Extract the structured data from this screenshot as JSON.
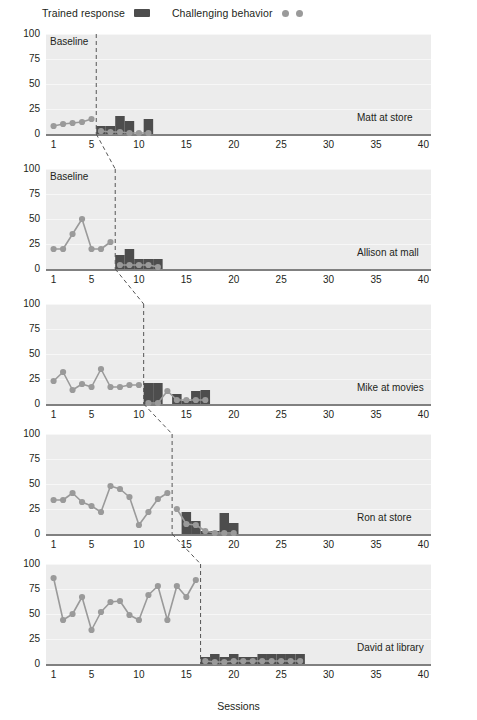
{
  "legend": {
    "trained_label": "Trained response",
    "trained_icon": "bar-swatch",
    "challenging_label": "Challenging behavior",
    "challenging_icon": "dot-swatch",
    "bar_color": "#4d4d4d",
    "dot_color": "#9a9a9a"
  },
  "axes": {
    "ylabel": "Percent of intervals",
    "xlabel": "Sessions",
    "yticks": [
      "0",
      "25",
      "50",
      "75",
      "100"
    ],
    "xticks": [
      "1",
      "5",
      "10",
      "15",
      "20",
      "25",
      "30",
      "35",
      "40"
    ],
    "xtick_values": [
      1,
      5,
      10,
      15,
      20,
      25,
      30,
      35,
      40
    ],
    "ylim": [
      0,
      100
    ],
    "xlim": [
      0.2,
      40.8
    ],
    "phase_label": "Baseline"
  },
  "panels": [
    {
      "label": "Matt at store",
      "phase_label": "Baseline",
      "phase_line_x": 5.5,
      "show_phase_label": true
    },
    {
      "label": "Allison at mall",
      "phase_label": "Baseline",
      "phase_line_x": 7.5,
      "show_phase_label": true
    },
    {
      "label": "Mike at movies",
      "phase_label": "",
      "phase_line_x": 10.5,
      "show_phase_label": false
    },
    {
      "label": "Ron at store",
      "phase_label": "",
      "phase_line_x": 13.5,
      "show_phase_label": false
    },
    {
      "label": "David at library",
      "phase_label": "",
      "phase_line_x": 16.5,
      "show_phase_label": false
    }
  ],
  "chart_data": {
    "type": "line",
    "title": "",
    "subtitle": "",
    "xlabel": "Sessions",
    "ylabel": "Percent of intervals",
    "xlim": [
      0.2,
      40.8
    ],
    "ylim": [
      0,
      100
    ],
    "yticks": [
      0,
      25,
      50,
      75,
      100
    ],
    "xticks": [
      1,
      5,
      10,
      15,
      20,
      25,
      30,
      35,
      40
    ],
    "grid": true,
    "legend_position": "top-left",
    "design": "multiple-baseline-across-participants",
    "series_legend": [
      "Trained response",
      "Challenging behavior"
    ],
    "panels": [
      {
        "name": "Matt at store",
        "phase_change_session": 5.5,
        "baseline": {
          "x": [
            1,
            2,
            3,
            4,
            5
          ],
          "challenging_behavior": [
            8,
            10,
            11,
            12,
            15
          ],
          "trained_response": [
            0,
            0,
            0,
            0,
            0
          ]
        },
        "intervention": {
          "x": [
            6,
            7,
            8,
            9,
            10,
            11
          ],
          "trained_response": [
            8,
            8,
            18,
            13,
            0,
            15
          ],
          "challenging_behavior": [
            3,
            2,
            2,
            1,
            1,
            1
          ]
        }
      },
      {
        "name": "Allison at mall",
        "phase_change_session": 7.5,
        "baseline": {
          "x": [
            1,
            2,
            3,
            4,
            5,
            6,
            7
          ],
          "challenging_behavior": [
            20,
            20,
            35,
            50,
            20,
            20,
            27
          ],
          "trained_response": [
            0,
            0,
            0,
            0,
            0,
            0,
            0
          ]
        },
        "intervention": {
          "x": [
            8,
            9,
            10,
            11,
            12
          ],
          "trained_response": [
            14,
            20,
            10,
            10,
            10
          ],
          "challenging_behavior": [
            4,
            4,
            4,
            4,
            2
          ]
        }
      },
      {
        "name": "Mike at movies",
        "phase_change_session": 10.5,
        "baseline": {
          "x": [
            1,
            2,
            3,
            4,
            5,
            6,
            7,
            8,
            9,
            10
          ],
          "challenging_behavior": [
            23,
            32,
            14,
            20,
            17,
            35,
            17,
            17,
            19,
            19
          ],
          "trained_response": [
            0,
            0,
            0,
            0,
            0,
            0,
            0,
            0,
            0,
            0
          ]
        },
        "intervention": {
          "x": [
            11,
            12,
            13,
            14,
            15,
            16,
            17
          ],
          "trained_response": [
            21,
            21,
            0,
            10,
            3,
            13,
            14
          ],
          "challenging_behavior": [
            1,
            1,
            13,
            4,
            4,
            4,
            4
          ]
        }
      },
      {
        "name": "Ron at store",
        "phase_change_session": 13.5,
        "baseline": {
          "x": [
            1,
            2,
            3,
            4,
            5,
            6,
            7,
            8,
            9,
            10,
            11,
            12,
            13
          ],
          "challenging_behavior": [
            34,
            34,
            41,
            32,
            28,
            22,
            48,
            45,
            37,
            9,
            22,
            35,
            41
          ],
          "trained_response": [
            0,
            0,
            0,
            0,
            0,
            0,
            0,
            0,
            0,
            0,
            0,
            0,
            0
          ]
        },
        "intervention": {
          "x": [
            14,
            15,
            16,
            17,
            18,
            19,
            20
          ],
          "trained_response": [
            0,
            22,
            13,
            3,
            3,
            21,
            11
          ],
          "challenging_behavior": [
            25,
            10,
            9,
            3,
            1,
            1,
            1
          ]
        }
      },
      {
        "name": "David at library",
        "phase_change_session": 16.5,
        "baseline": {
          "x": [
            1,
            2,
            3,
            4,
            5,
            6,
            7,
            8,
            9,
            10,
            11,
            12,
            13,
            14,
            15,
            16
          ],
          "challenging_behavior": [
            86,
            44,
            50,
            67,
            34,
            52,
            62,
            63,
            49,
            44,
            69,
            78,
            44,
            78,
            67,
            84
          ],
          "trained_response": [
            0,
            0,
            0,
            0,
            0,
            0,
            0,
            0,
            0,
            0,
            0,
            0,
            0,
            0,
            0,
            0
          ]
        },
        "intervention": {
          "x": [
            17,
            18,
            19,
            20,
            21,
            22,
            23,
            24,
            25,
            26,
            27
          ],
          "trained_response": [
            7,
            10,
            7,
            10,
            7,
            7,
            10,
            10,
            10,
            10,
            10
          ],
          "challenging_behavior": [
            3,
            2,
            2,
            3,
            3,
            3,
            3,
            3,
            3,
            3,
            3
          ]
        }
      }
    ]
  }
}
